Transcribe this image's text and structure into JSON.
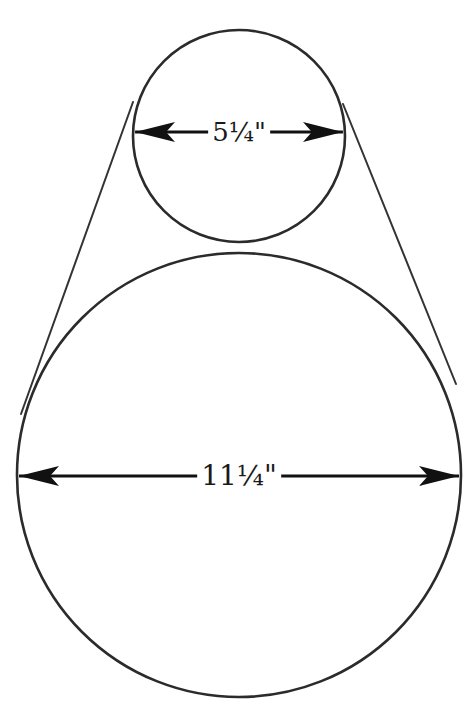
{
  "diagram": {
    "type": "pulley-belt-dimension-drawing",
    "stroke_color": "#2b2b2b",
    "background": "#ffffff",
    "small_pulley": {
      "label": "5¼\"",
      "diameter_text": "5¼\"",
      "cx": 239,
      "cy": 136,
      "r": 106,
      "dimension_y": 132
    },
    "large_pulley": {
      "label": "11¼\"",
      "diameter_text": "11¼\"",
      "cx": 239,
      "cy": 475,
      "r": 222,
      "dimension_y": 476
    },
    "belt_lines": [
      {
        "side": "left",
        "x1": 133,
        "y1": 102,
        "x2": 21,
        "y2": 414
      },
      {
        "side": "right",
        "x1": 343,
        "y1": 104,
        "x2": 456,
        "y2": 384
      }
    ]
  }
}
